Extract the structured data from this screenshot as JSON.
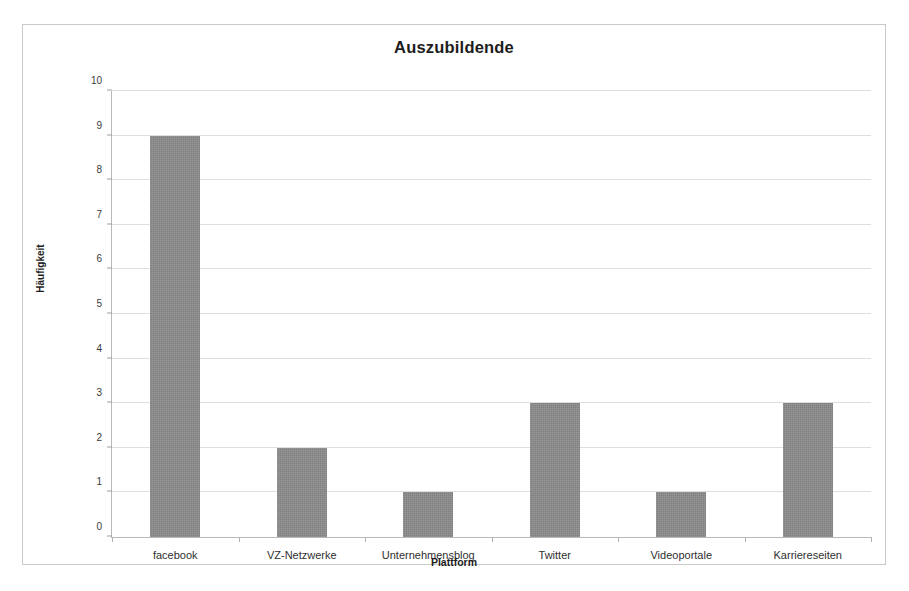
{
  "chart_data": {
    "type": "bar",
    "title": "Auszubildende",
    "xlabel": "Plattform",
    "ylabel": "Häufigkeit",
    "categories": [
      "facebook",
      "VZ-Netzwerke",
      "Unternehmensblog",
      "Twitter",
      "Videoportale",
      "Karriereseiten"
    ],
    "values": [
      9,
      2,
      1,
      3,
      1,
      3
    ],
    "ylim": [
      0,
      10
    ],
    "ytick_labels": [
      "0",
      "1",
      "2",
      "3",
      "4",
      "5",
      "6",
      "7",
      "8",
      "9",
      "10"
    ],
    "ytick_values": [
      0,
      1,
      2,
      3,
      4,
      5,
      6,
      7,
      8,
      9,
      10
    ],
    "grid": true,
    "legend": false,
    "bar_color": "#8b8b8b",
    "grid_color": "#dedede",
    "axis_color": "#b9b9b9",
    "background_color": "#ffffff"
  }
}
